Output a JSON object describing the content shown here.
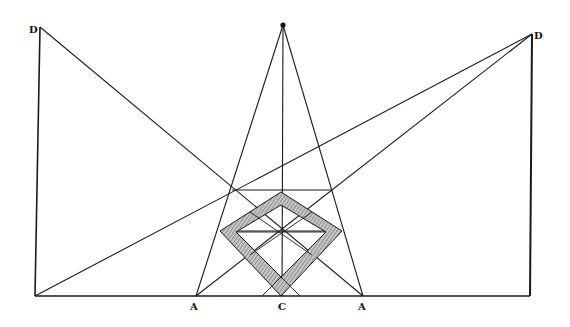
{
  "figure": {
    "type": "perspective construction diagram",
    "labels": {
      "d_left": "D",
      "d_right": "D",
      "a_left": "A",
      "c_center": "C",
      "a_right": "A"
    },
    "colors": {
      "ink": "#1a1a1a",
      "hatch": "#8a8a8a",
      "background": "#ffffff"
    },
    "points": {
      "vanishing_point": [
        283,
        25
      ],
      "d_left": [
        40,
        27
      ],
      "d_right": [
        532,
        34
      ],
      "base_left": [
        35,
        296
      ],
      "base_right": [
        530,
        296
      ],
      "a_left": [
        196,
        296
      ],
      "c": [
        282,
        296
      ],
      "a_right": [
        363,
        296
      ]
    }
  }
}
